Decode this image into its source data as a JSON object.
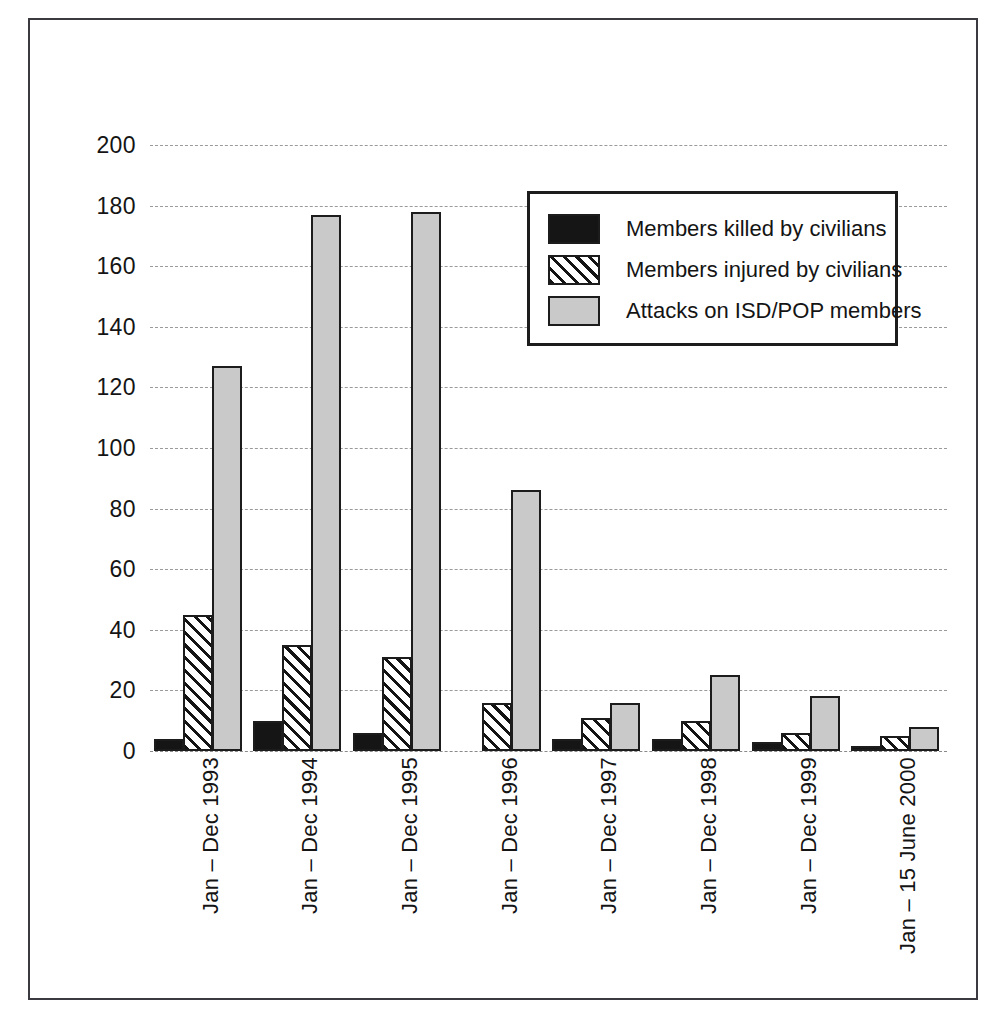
{
  "chart_data": {
    "type": "bar",
    "title": "",
    "subtitle": "",
    "xlabel": "",
    "ylabel": "",
    "ylim": [
      0,
      200
    ],
    "ytick_step": 20,
    "yticks": [
      200,
      180,
      160,
      140,
      120,
      100,
      80,
      60,
      40,
      20,
      0
    ],
    "grid": true,
    "grid_style": "dashed-horizontal",
    "legend_position": "upper-center",
    "categories": [
      "Jan – Dec 1993",
      "Jan – Dec 1994",
      "Jan – Dec 1995",
      "Jan – Dec 1996",
      "Jan – Dec 1997",
      "Jan – Dec 1998",
      "Jan – Dec 1999",
      "Jan – 15 June 2000"
    ],
    "series": [
      {
        "name": "Members killed by civilians",
        "pattern": "solid-black",
        "color": "#151515",
        "values": [
          4,
          10,
          6,
          0,
          4,
          4,
          3,
          1.5
        ]
      },
      {
        "name": "Members injured by civilians",
        "pattern": "diagonal-hatch",
        "color": "#ffffff",
        "values": [
          45,
          35,
          31,
          16,
          11,
          10,
          6,
          5
        ]
      },
      {
        "name": "Attacks on ISD/POP members",
        "pattern": "light-gray",
        "color": "#c9c9c9",
        "values": [
          127,
          177,
          178,
          86,
          16,
          25,
          18,
          8
        ]
      }
    ]
  }
}
